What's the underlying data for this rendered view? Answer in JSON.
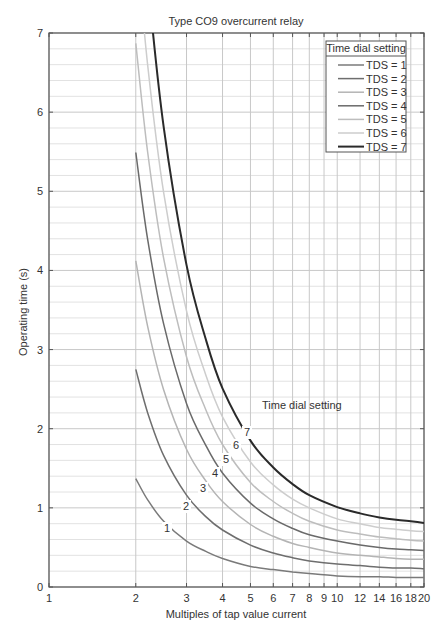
{
  "chart_data": {
    "type": "line",
    "title": "Type CO9 overcurrent relay",
    "xlabel": "Multiples of tap value current",
    "ylabel": "Operating time (s)",
    "xscale": "log",
    "xlim": [
      1,
      20
    ],
    "ylim": [
      0,
      7
    ],
    "x_ticks": [
      1,
      2,
      3,
      4,
      5,
      6,
      7,
      8,
      9,
      10,
      12,
      14,
      16,
      18,
      20
    ],
    "y_ticks": [
      0,
      1,
      2,
      3,
      4,
      5,
      6,
      7
    ],
    "y_minor_step": 0.2,
    "grid": true,
    "legend": {
      "title": "Time dial setting",
      "position": "upper right",
      "entries": [
        "TDS = 1",
        "TDS = 2",
        "TDS = 3",
        "TDS = 4",
        "TDS = 5",
        "TDS = 6",
        "TDS = 7"
      ]
    },
    "annotation": {
      "text": "Time dial setting",
      "labels": [
        "1",
        "2",
        "3",
        "4",
        "5",
        "6",
        "7"
      ]
    },
    "x": [
      2,
      2.2,
      2.5,
      3,
      3.5,
      4,
      5,
      6,
      7,
      8,
      10,
      12,
      14,
      16,
      18,
      20
    ],
    "series": [
      {
        "name": "TDS = 1",
        "color": "#7a7a7a",
        "width": 1.5,
        "values": [
          1.37,
          1.1,
          0.83,
          0.58,
          0.45,
          0.36,
          0.26,
          0.22,
          0.19,
          0.17,
          0.14,
          0.13,
          0.13,
          0.12,
          0.12,
          0.12
        ]
      },
      {
        "name": "TDS = 2",
        "color": "#6e6e6e",
        "width": 1.5,
        "values": [
          2.75,
          2.2,
          1.66,
          1.16,
          0.89,
          0.72,
          0.53,
          0.43,
          0.37,
          0.33,
          0.29,
          0.27,
          0.25,
          0.24,
          0.24,
          0.23
        ]
      },
      {
        "name": "TDS = 3",
        "color": "#b4b4b4",
        "width": 1.5,
        "values": [
          4.12,
          3.29,
          2.49,
          1.74,
          1.34,
          1.08,
          0.79,
          0.64,
          0.55,
          0.5,
          0.43,
          0.4,
          0.38,
          0.36,
          0.35,
          0.35
        ]
      },
      {
        "name": "TDS = 4",
        "color": "#6a6a6a",
        "width": 1.5,
        "values": [
          5.49,
          4.39,
          3.32,
          2.32,
          1.79,
          1.44,
          1.06,
          0.86,
          0.74,
          0.66,
          0.58,
          0.53,
          0.5,
          0.48,
          0.47,
          0.46
        ]
      },
      {
        "name": "TDS = 5",
        "color": "#bdbdbd",
        "width": 1.5,
        "values": [
          6.87,
          5.49,
          4.15,
          2.91,
          2.24,
          1.8,
          1.32,
          1.08,
          0.93,
          0.83,
          0.72,
          0.67,
          0.63,
          0.61,
          0.59,
          0.58
        ]
      },
      {
        "name": "TDS = 6",
        "color": "#cdcdcd",
        "width": 1.5,
        "values": [
          8.24,
          6.59,
          4.98,
          3.49,
          2.68,
          2.15,
          1.58,
          1.29,
          1.11,
          1.0,
          0.86,
          0.8,
          0.75,
          0.73,
          0.71,
          0.7
        ]
      },
      {
        "name": "TDS = 7",
        "color": "#2a2a2a",
        "width": 2,
        "values": [
          9.61,
          7.69,
          5.81,
          4.07,
          3.13,
          2.51,
          1.85,
          1.51,
          1.3,
          1.16,
          1.01,
          0.93,
          0.88,
          0.85,
          0.83,
          0.81
        ]
      }
    ]
  }
}
